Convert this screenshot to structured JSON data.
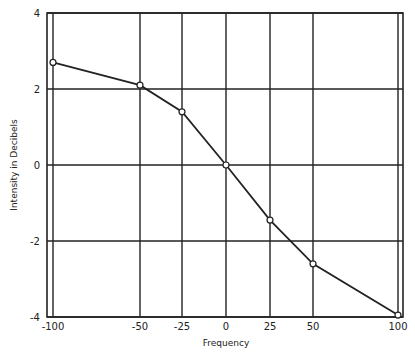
{
  "chart_data": {
    "type": "line",
    "title": "",
    "xlabel": "Frequency",
    "ylabel": "Intensity in Decibels",
    "x_ticks": [
      -100,
      -50,
      -25,
      0,
      25,
      50,
      100
    ],
    "y_ticks": [
      4,
      2,
      0,
      -2,
      -4
    ],
    "x_tick_labels": [
      "-100",
      "-50",
      "-25",
      "0",
      "25",
      "50",
      "100"
    ],
    "y_tick_labels": [
      "4",
      "2",
      "0",
      "-2",
      "-4"
    ],
    "xlim": [
      -100,
      100
    ],
    "ylim": [
      -4,
      4
    ],
    "grid": true,
    "legend": null,
    "series": [
      {
        "name": "Intensity",
        "marker": "open-circle",
        "x": [
          -100,
          -50,
          -25,
          0,
          25,
          50,
          100
        ],
        "y": [
          2.7,
          2.1,
          1.4,
          0.0,
          -1.45,
          -2.6,
          -3.95
        ]
      }
    ]
  }
}
